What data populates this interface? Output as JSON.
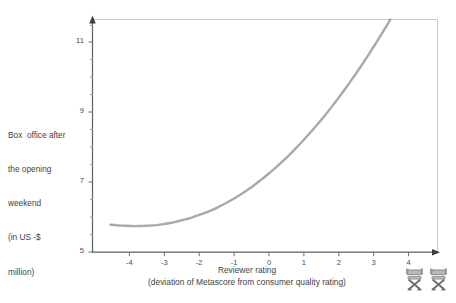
{
  "chart_data": {
    "type": "line",
    "title": "",
    "subtitle": "",
    "xlabel": "Reviewer rating",
    "xlabel_sub": "(deviation of Metascore from consumer quality rating)",
    "ylabel_lines": [
      "Box  office after",
      "the opening",
      "weekend",
      "(in US -$",
      "million)"
    ],
    "ylabel": "Box office after the opening weekend (in US -$ million)",
    "xlim": [
      -4.9,
      4.75
    ],
    "ylim": [
      5,
      11.45
    ],
    "xtick_labels": [
      "-4",
      "-3",
      "-2",
      "-1",
      "0",
      "1",
      "2",
      "3",
      "4"
    ],
    "xticks": [
      -4,
      -3,
      -2,
      -1,
      0,
      1,
      2,
      3,
      4
    ],
    "ytick_labels": [
      "11",
      "9",
      "7",
      "5"
    ],
    "yticks": [
      11,
      9,
      7,
      5
    ],
    "y_minor_ticks": [
      5.5,
      6,
      6.5,
      7.5,
      8,
      8.5,
      9.5,
      10,
      10.5,
      11
    ],
    "grid": false,
    "legend": "none",
    "series": [
      {
        "name": "Predicted box office",
        "color": "#a9a9a9",
        "x": [
          -4.4,
          -4.2,
          -4.0,
          -3.8,
          -3.6,
          -3.4,
          -3.2,
          -3.0,
          -2.8,
          -2.6,
          -2.4,
          -2.2,
          -2.0,
          -1.8,
          -1.6,
          -1.4,
          -1.2,
          -1.0,
          -0.8,
          -0.6,
          -0.4,
          -0.2,
          0.0,
          0.2,
          0.4,
          0.6,
          0.8,
          1.0,
          1.2,
          1.4,
          1.6,
          1.8,
          2.0,
          2.2,
          2.4,
          2.6,
          2.8,
          3.0,
          3.2,
          3.4,
          3.6,
          3.8,
          4.0,
          4.2,
          4.4,
          4.6
        ],
        "y": [
          5.76,
          5.74,
          5.73,
          5.72,
          5.72,
          5.73,
          5.74,
          5.76,
          5.79,
          5.83,
          5.88,
          5.93,
          6.0,
          6.07,
          6.15,
          6.24,
          6.34,
          6.45,
          6.57,
          6.7,
          6.84,
          6.99,
          7.15,
          7.32,
          7.5,
          7.69,
          7.89,
          8.1,
          8.32,
          8.55,
          8.79,
          9.04,
          9.3,
          9.57,
          9.85,
          10.14,
          10.44,
          10.75,
          11.07,
          11.4,
          11.74,
          12.09,
          12.45,
          12.82,
          13.2,
          13.59
        ]
      }
    ],
    "axis_color": "#6a6a6a",
    "curve_color": "#a9a9a9",
    "background_color": "#ffffff"
  },
  "icons": {
    "chair_left": "directors-chair-icon",
    "chair_right": "directors-chair-icon"
  }
}
